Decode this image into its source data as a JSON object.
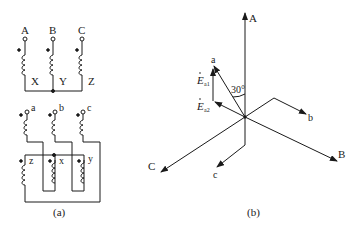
{
  "figure_a": {
    "caption": "(a)",
    "primary_terminals": [
      "A",
      "B",
      "C"
    ],
    "primary_ends": [
      "X",
      "Y",
      "Z"
    ],
    "secondary_terminals": [
      "a",
      "b",
      "c"
    ],
    "secondary_ends": [
      "z",
      "x",
      "y"
    ]
  },
  "figure_b": {
    "caption": "(b)",
    "primary_phasors": [
      "A",
      "B",
      "C"
    ],
    "secondary_phasors": [
      "a",
      "b",
      "c"
    ],
    "component_1": {
      "symbol": "E",
      "subscript": "a1"
    },
    "component_2": {
      "symbol": "E",
      "subscript": "a2"
    },
    "angle_label": "30°"
  },
  "colors": {
    "line": "#1a1a1a",
    "background": "#ffffff"
  }
}
